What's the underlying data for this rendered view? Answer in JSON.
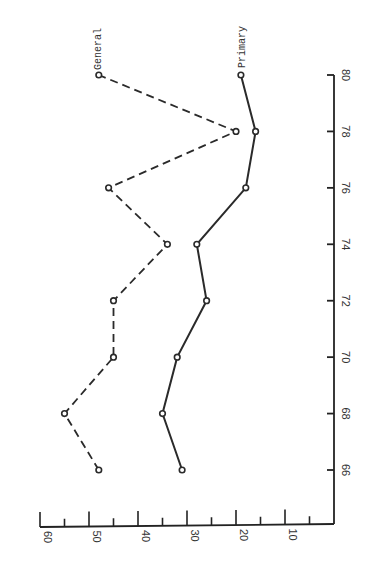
{
  "chart_data": {
    "type": "line",
    "orientation": "rotated-90-clockwise",
    "title": "",
    "xlabel": "",
    "ylabel": "",
    "x": [
      66,
      68,
      70,
      72,
      74,
      76,
      78,
      80
    ],
    "series": [
      {
        "name": "General",
        "style": "dashed",
        "values": [
          48,
          55,
          45,
          45,
          34,
          46,
          20,
          48
        ]
      },
      {
        "name": "Primary",
        "style": "solid",
        "values": [
          31,
          35,
          32,
          26,
          28,
          18,
          16,
          19
        ]
      }
    ],
    "xlim": [
      65,
      80
    ],
    "ylim": [
      0,
      60
    ],
    "x_ticks": [
      "66",
      "68",
      "70",
      "72",
      "74",
      "76",
      "78",
      "80"
    ],
    "y_ticks": [
      "10",
      "20",
      "30",
      "40",
      "50",
      "60"
    ],
    "grid": false,
    "legend": "inline labels at series ends"
  },
  "labels": {
    "general": "General",
    "primary": "Primary"
  },
  "axis": {
    "x_ticks": [
      "66",
      "68",
      "70",
      "72",
      "74",
      "76",
      "78",
      "80"
    ],
    "y_ticks": [
      "10",
      "20",
      "30",
      "40",
      "50",
      "60"
    ]
  },
  "colors": {
    "line": "#2a2a2a",
    "axis": "#222222",
    "background": "#ffffff"
  }
}
